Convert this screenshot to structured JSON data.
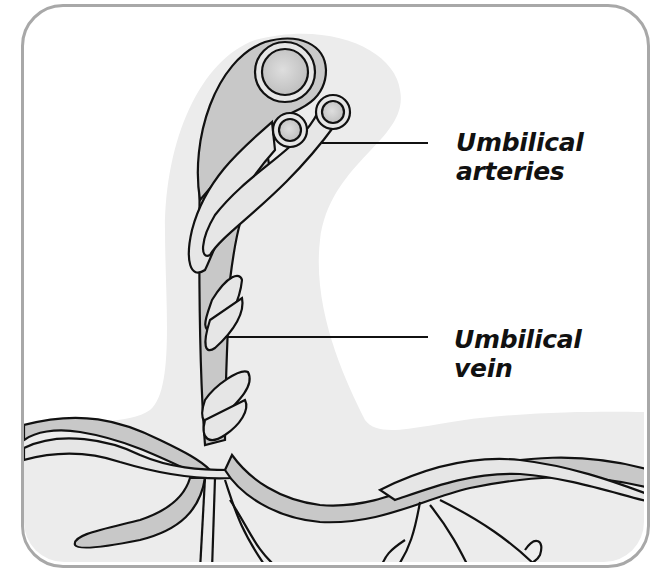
{
  "diagram": {
    "labels": [
      {
        "id": "arteries",
        "lines": [
          "Umbilical",
          "arteries"
        ]
      },
      {
        "id": "vein",
        "lines": [
          "Umbilical",
          "vein"
        ]
      }
    ],
    "colors": {
      "frame_border": "#a8a8a8",
      "background_shade": "#ececec",
      "vessel_dark": "#c8c8c8",
      "vessel_light": "#e6e6e6",
      "outline": "#111111",
      "text": "#111111"
    }
  }
}
